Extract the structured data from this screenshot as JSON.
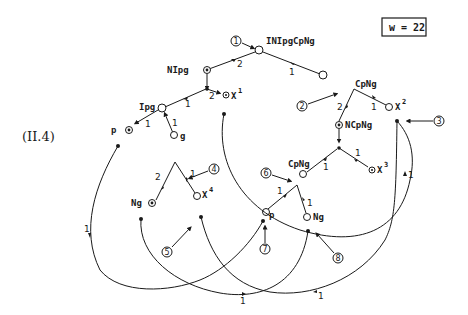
{
  "equation_label": "(II.4)",
  "weight_box": "w = 22",
  "node_labels": {
    "root": "INIpgCpNg",
    "nipg": "NIpg",
    "ipg": "Ipg",
    "p_top": "p",
    "g": "g",
    "x1": "X",
    "x1_sup": "1",
    "cpng_top": "CpNg",
    "x2": "X",
    "x2_sup": "2",
    "ncpng": "NCpNg",
    "cpng_low": "CpNg",
    "x3": "X",
    "x3_sup": "3",
    "x4": "X",
    "x4_sup": "4",
    "ng_left": "Ng",
    "p_low": "p",
    "ng_low": "Ng"
  },
  "edge_labels": [
    "2",
    "1",
    "2",
    "1",
    "1",
    "1",
    "2",
    "1",
    "1",
    "1",
    "2",
    "1",
    "1",
    "1",
    "1",
    "1",
    "1",
    "1"
  ],
  "callouts": [
    "1",
    "2",
    "3",
    "4",
    "5",
    "6",
    "7",
    "8"
  ]
}
